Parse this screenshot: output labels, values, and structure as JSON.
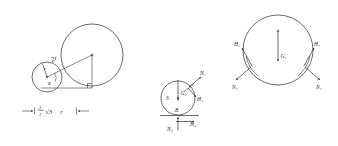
{
  "figure": {
    "background_color": "#ffffff",
    "ink_color": "#2b2b2b"
  },
  "panels": [
    {
      "id": "geometry",
      "name": "geometric-construction",
      "description": "Small circle of radius r tangent to large circle of radius 2r, with right triangle and angle alpha",
      "circles": [
        {
          "name": "small-circle",
          "cx": 47,
          "cy": 77,
          "r": 15,
          "radius_label": "r"
        },
        {
          "name": "large-circle",
          "cx": 92,
          "cy": 55,
          "r": 31,
          "radius_label": "2r"
        }
      ],
      "labels": {
        "hypotenuse": "2r",
        "small_radius": "r",
        "angle": "α",
        "dimension": {
          "numerator": "3",
          "denominator": "2",
          "radical": "√3",
          "variable": "r",
          "full": "3/2 √3 r"
        }
      },
      "triangle": {
        "apex": [
          92,
          55
        ],
        "corner": [
          92,
          88
        ],
        "base_left": [
          47,
          88
        ]
      }
    },
    {
      "id": "small-ball-fbd",
      "name": "small-ball-free-body-diagram",
      "description": "Free-body diagram of the small ball S showing weight G2, contact forces N1, H1 at top right and ground reactions N2, H2 at bottom",
      "circle": {
        "name": "small-ball",
        "cx": 178,
        "cy": 98,
        "r": 17
      },
      "center_label": "S",
      "contact_point_label": "B",
      "forces": [
        {
          "name": "weight-G2",
          "label": "G₂",
          "direction": "down",
          "at": "center"
        },
        {
          "name": "normal-N1",
          "label": "N₁",
          "direction": "up-right",
          "at": "upper-right-contact"
        },
        {
          "name": "friction-H1",
          "label": "H₁",
          "direction": "down-right",
          "at": "upper-right-contact"
        },
        {
          "name": "normal-N2",
          "label": "N₂",
          "direction": "up",
          "at": "ground-contact"
        },
        {
          "name": "friction-H2",
          "label": "H₂",
          "direction": "right",
          "at": "ground-contact"
        }
      ]
    },
    {
      "id": "large-ball-fbd",
      "name": "large-ball-free-body-diagram",
      "description": "Free-body diagram of the large ball showing weight G1 and symmetric contact forces H1 and N1 on both sides",
      "circle": {
        "name": "large-ball",
        "cx": 278,
        "cy": 50,
        "r": 35
      },
      "forces": [
        {
          "name": "weight-G1",
          "label": "G₁",
          "direction": "down",
          "at": "center"
        },
        {
          "name": "friction-H1-left",
          "label": "H₁",
          "direction": "up-left-tangent",
          "at": "left-contact"
        },
        {
          "name": "normal-N1-left",
          "label": "N₁",
          "direction": "down-left",
          "at": "left-contact"
        },
        {
          "name": "friction-H1-right",
          "label": "H₁",
          "direction": "up-right-tangent",
          "at": "right-contact"
        },
        {
          "name": "normal-N1-right",
          "label": "N₁",
          "direction": "down-right",
          "at": "right-contact"
        }
      ]
    }
  ]
}
